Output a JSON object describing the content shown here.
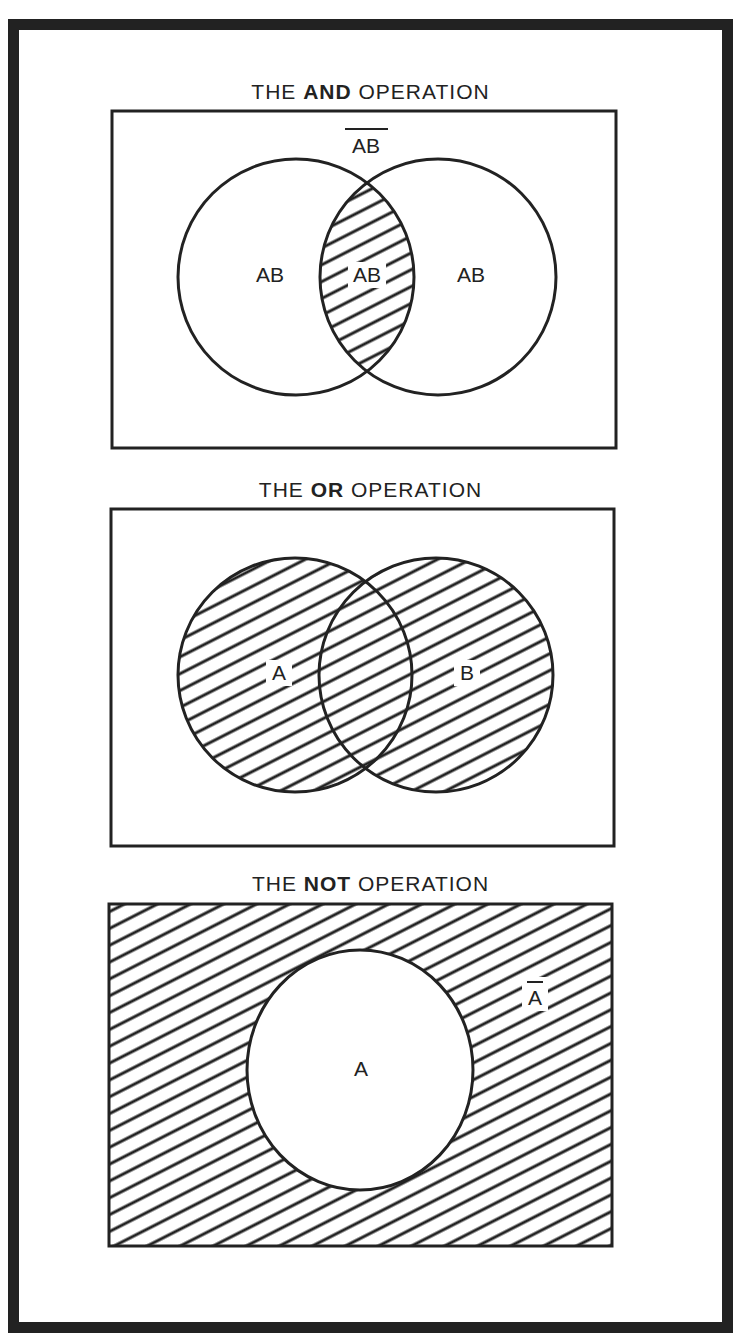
{
  "panels": {
    "and": {
      "title_prefix": "THE ",
      "title_bold": "AND",
      "title_suffix": " OPERATION",
      "outside_label": "AB",
      "outside_label_overbar": true,
      "left_label": "AB",
      "intersection_label": "AB",
      "right_label": "AB",
      "shaded_region": "intersection"
    },
    "or": {
      "title_prefix": "THE ",
      "title_bold": "OR",
      "title_suffix": " OPERATION",
      "left_label": "A",
      "right_label": "B",
      "shaded_region": "union"
    },
    "not": {
      "title_prefix": "THE ",
      "title_bold": "NOT",
      "title_suffix": " OPERATION",
      "circle_label": "A",
      "outside_label": "A",
      "outside_label_overbar": true,
      "shaded_region": "complement"
    }
  },
  "colors": {
    "ink": "#222222",
    "paper": "#ffffff"
  }
}
